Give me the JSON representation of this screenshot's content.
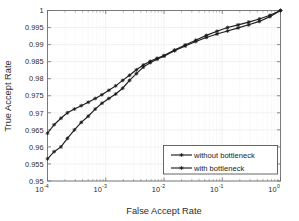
{
  "chart_data": {
    "type": "line",
    "title": "",
    "xlabel": "False Accept Rate",
    "ylabel": "True Accept Rate",
    "xscale": "log",
    "yscale": "linear",
    "xlim": [
      0.0001,
      1
    ],
    "ylim": [
      0.95,
      1
    ],
    "grid": true,
    "legend_position": "lower right",
    "xticks": [
      0.0001,
      0.001,
      0.01,
      0.1,
      1
    ],
    "xtick_labels": [
      "10-4",
      "10-3",
      "10-2",
      "10-1",
      "100"
    ],
    "xtick_mantissa": [
      "10",
      "10",
      "10",
      "10",
      "10"
    ],
    "xtick_exponents": [
      "-4",
      "-3",
      "-2",
      "-1",
      "0"
    ],
    "yticks": [
      0.95,
      0.955,
      0.96,
      0.965,
      0.97,
      0.975,
      0.98,
      0.985,
      0.99,
      0.995,
      1
    ],
    "ytick_labels": [
      "0.95",
      "0.955",
      "0.96",
      "0.965",
      "0.97",
      "0.975",
      "0.98",
      "0.985",
      "0.99",
      "0.995",
      "1"
    ],
    "series": [
      {
        "name": "without bottleneck",
        "color": "#1c1c1c",
        "marker": "star",
        "x": [
          0.0001,
          0.00013,
          0.00017,
          0.00022,
          0.00029,
          0.00038,
          0.0005,
          0.00066,
          0.00086,
          0.00113,
          0.00148,
          0.00195,
          0.00256,
          0.00336,
          0.00441,
          0.0058,
          0.00761,
          0.01,
          0.0152,
          0.0231,
          0.0351,
          0.0534,
          0.0811,
          0.1233,
          0.1874,
          0.2848,
          0.4329,
          0.6579,
          1.0
        ],
        "y": [
          0.964,
          0.9665,
          0.9684,
          0.97,
          0.9711,
          0.9721,
          0.9731,
          0.9742,
          0.9753,
          0.9766,
          0.9779,
          0.9795,
          0.981,
          0.9826,
          0.984,
          0.9851,
          0.986,
          0.9868,
          0.9884,
          0.9899,
          0.9913,
          0.9927,
          0.9939,
          0.995,
          0.9958,
          0.9966,
          0.9975,
          0.9986,
          1.0
        ]
      },
      {
        "name": "with bottleneck",
        "color": "#1c1c1c",
        "marker": "star",
        "x": [
          0.0001,
          0.00013,
          0.00017,
          0.00022,
          0.00029,
          0.00038,
          0.0005,
          0.00066,
          0.00086,
          0.00113,
          0.00148,
          0.00195,
          0.00256,
          0.00336,
          0.00441,
          0.0058,
          0.00761,
          0.01,
          0.0152,
          0.0231,
          0.0351,
          0.0534,
          0.0811,
          0.1233,
          0.1874,
          0.2848,
          0.4329,
          0.6579,
          1.0
        ],
        "y": [
          0.9565,
          0.9586,
          0.96,
          0.9625,
          0.965,
          0.9672,
          0.969,
          0.9711,
          0.9728,
          0.9742,
          0.9755,
          0.9772,
          0.9795,
          0.9815,
          0.9834,
          0.9847,
          0.9857,
          0.9866,
          0.9882,
          0.9896,
          0.9909,
          0.9921,
          0.9931,
          0.994,
          0.9949,
          0.9958,
          0.9968,
          0.9982,
          1.0
        ]
      }
    ],
    "legend": [
      {
        "label": "without bottleneck"
      },
      {
        "label": "with bottleneck"
      }
    ]
  }
}
